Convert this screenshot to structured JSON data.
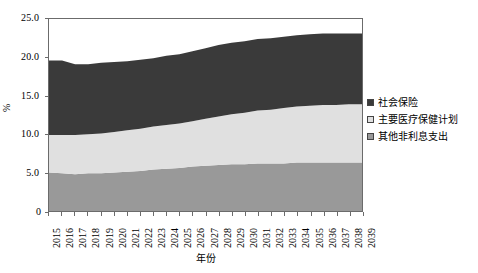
{
  "chart_data": {
    "type": "area",
    "stacked": true,
    "title": "",
    "xlabel": "年份",
    "ylabel": "%",
    "grid": false,
    "legend_position": "right",
    "xlim": [
      2015,
      2039
    ],
    "ylim": [
      0,
      25
    ],
    "y_ticks": [
      0,
      5.0,
      10.0,
      15.0,
      20.0,
      25.0
    ],
    "y_tick_labels": [
      "0",
      "5.0",
      "10.0",
      "15.0",
      "20.0",
      "25.0"
    ],
    "categories": [
      "2015",
      "2016",
      "2017",
      "2018",
      "2019",
      "2020",
      "2021",
      "2022",
      "2023",
      "2024",
      "2025",
      "2026",
      "2027",
      "2028",
      "2029",
      "2030",
      "2031",
      "2032",
      "2033",
      "2034",
      "2035",
      "2036",
      "2037",
      "2038",
      "2039"
    ],
    "series": [
      {
        "name": "其他非利息支出",
        "color": "#999999",
        "values": [
          5.0,
          4.9,
          4.8,
          4.9,
          4.9,
          5.0,
          5.1,
          5.2,
          5.4,
          5.5,
          5.6,
          5.8,
          5.9,
          6.0,
          6.1,
          6.1,
          6.2,
          6.2,
          6.2,
          6.3,
          6.3,
          6.3,
          6.3,
          6.3,
          6.3
        ]
      },
      {
        "name": "主要医疗保健计划",
        "color": "#e0e0e0",
        "values": [
          4.9,
          5.0,
          5.1,
          5.1,
          5.2,
          5.3,
          5.4,
          5.5,
          5.6,
          5.7,
          5.8,
          5.9,
          6.1,
          6.3,
          6.5,
          6.7,
          6.9,
          7.0,
          7.2,
          7.3,
          7.4,
          7.5,
          7.5,
          7.6,
          7.6
        ]
      },
      {
        "name": "社会保险",
        "color": "#3a3a3a",
        "values": [
          9.7,
          9.7,
          9.2,
          9.1,
          9.2,
          9.1,
          9.0,
          9.0,
          8.9,
          9.0,
          9.0,
          9.1,
          9.2,
          9.3,
          9.3,
          9.3,
          9.3,
          9.3,
          9.3,
          9.3,
          9.3,
          9.3,
          9.3,
          9.2,
          9.2
        ]
      }
    ],
    "stack_totals": [
      19.6,
      19.6,
      19.1,
      19.1,
      19.3,
      19.4,
      19.5,
      19.7,
      19.9,
      20.2,
      20.4,
      20.8,
      21.2,
      21.6,
      21.9,
      22.1,
      22.4,
      22.5,
      22.7,
      22.9,
      23.0,
      23.1,
      23.1,
      23.1,
      23.1
    ]
  },
  "legend": {
    "items": [
      {
        "label": "社会保险",
        "color": "#3a3a3a"
      },
      {
        "label": "主要医疗保健计划",
        "color": "#e0e0e0"
      },
      {
        "label": "其他非利息支出",
        "color": "#999999"
      }
    ]
  },
  "axes": {
    "y_title": "%",
    "x_title": "年份",
    "zero_label": "0"
  },
  "colors": {
    "frame": "#6b6b6b",
    "background": "#ffffff",
    "series_dark": "#3a3a3a",
    "series_light": "#e0e0e0",
    "series_medium": "#999999"
  }
}
